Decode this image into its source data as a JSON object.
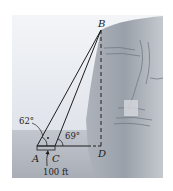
{
  "diagram": {
    "type": "trigonometry-cliff-height",
    "points": {
      "A": {
        "label": "A"
      },
      "B": {
        "label": "B"
      },
      "C": {
        "label": "C"
      },
      "D": {
        "label": "D"
      }
    },
    "angles": {
      "at_A": "62°",
      "at_C": "69°"
    },
    "distance_AC": "100 ft",
    "colors": {
      "sky": "#e9edf3",
      "ground": "#b9bec7",
      "cliff_light": "#c9ccd2",
      "cliff_dark": "#8d939c",
      "line": "#1e1e1e"
    }
  }
}
